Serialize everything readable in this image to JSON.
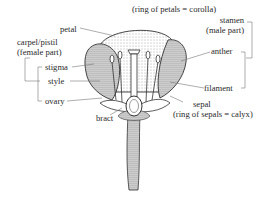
{
  "diagram": {
    "labels": {
      "corolla": "(ring of petals = corolla)",
      "petal": "petal",
      "carpel_line1": "carpel/pistil",
      "carpel_line2": "(female part)",
      "stigma": "stigma",
      "style": "style",
      "ovary": "ovary",
      "bract": "bract",
      "stamen_line1": "stamen",
      "stamen_line2": "(male part)",
      "anther": "anther",
      "filament": "filament",
      "sepal": "sepal",
      "calyx": "(ring of sepals = calyx)"
    },
    "colors": {
      "ink": "#2a2a2a",
      "leader": "#777777",
      "background": "#ffffff"
    }
  }
}
